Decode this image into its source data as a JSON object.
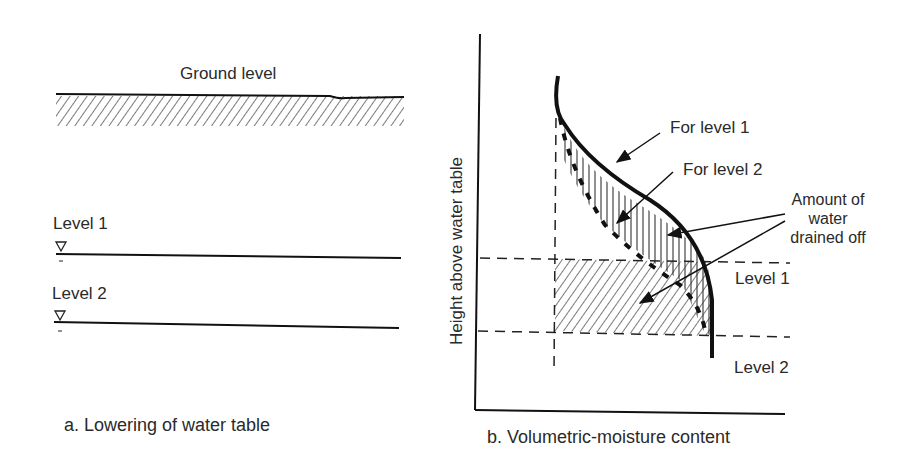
{
  "panel_a": {
    "ground_label": "Ground level",
    "level1_label": "Level 1",
    "level2_label": "Level 2",
    "water_table_icon": "inverted-triangle",
    "caption": "a. Lowering of water table"
  },
  "panel_b": {
    "y_axis_label": "Height above water table",
    "caption": "b. Volumetric-moisture content",
    "annotations": {
      "for_level_1": "For level 1",
      "for_level_2": "For level 2",
      "drained_line1": "Amount of",
      "drained_line2": "water",
      "drained_line3": "drained off",
      "level1": "Level 1",
      "level2": "Level 2"
    }
  }
}
